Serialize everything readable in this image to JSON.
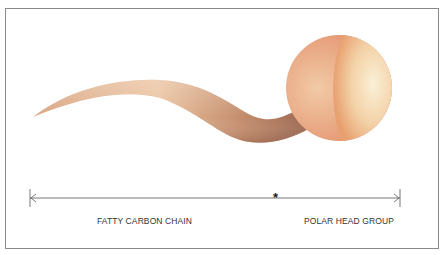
{
  "diagram": {
    "title": "",
    "labels": {
      "tail": "FATTY CARBON CHAIN",
      "head": "POLAR HEAD GROUP"
    },
    "divider_symbol": "*",
    "colors": {
      "head_light": "#f7e6c4",
      "head_dark": "#e8906a",
      "tail_light": "#ecc29c",
      "tail_dark": "#a9735a",
      "border": "#8a8a8a",
      "line": "#555555"
    }
  }
}
